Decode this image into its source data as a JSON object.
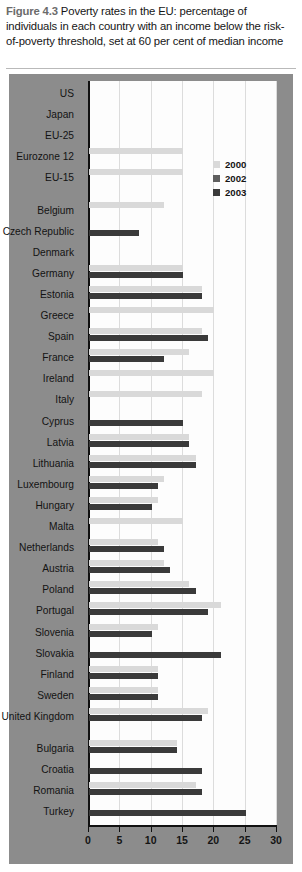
{
  "caption": {
    "figure_number": "Figure 4.3",
    "text": " Poverty rates in the EU: percentage of individuals in each country with an income below the risk-of-poverty threshold, set at 60 per cent of median income"
  },
  "legend": {
    "position": "top-right",
    "items": [
      {
        "label": "2000",
        "color": "#d9d9d9"
      },
      {
        "label": "2002",
        "color": "#5e5e5e"
      },
      {
        "label": "2003",
        "color": "#3a3a3a"
      }
    ]
  },
  "axis": {
    "x_ticks": [
      "0",
      "5",
      "10",
      "15",
      "20",
      "25",
      "30"
    ],
    "x_min": 0,
    "x_max": 30
  },
  "chart_data": {
    "type": "bar",
    "orientation": "horizontal",
    "title": "Poverty rates in the EU: percentage of individuals in each country with an income below the risk-of-poverty threshold, set at 60 per cent of median income",
    "xlabel": "",
    "ylabel": "",
    "xlim": [
      0,
      30
    ],
    "grid": "vertical",
    "legend_position": "top-right",
    "series": [
      {
        "name": "2000",
        "color": "#d9d9d9"
      },
      {
        "name": "2002",
        "color": "#5e5e5e"
      },
      {
        "name": "2003",
        "color": "#3a3a3a"
      }
    ],
    "categories": [
      "US",
      "Japan",
      "EU-25",
      "Eurozone 12",
      "EU-15",
      "Belgium",
      "Czech Republic",
      "Denmark",
      "Germany",
      "Estonia",
      "Greece",
      "Spain",
      "France",
      "Ireland",
      "Italy",
      "Cyprus",
      "Latvia",
      "Lithuania",
      "Luxembourg",
      "Hungary",
      "Malta",
      "Netherlands",
      "Austria",
      "Poland",
      "Portugal",
      "Slovenia",
      "Slovakia",
      "Finland",
      "Sweden",
      "United Kingdom",
      "Bulgaria",
      "Croatia",
      "Romania",
      "Turkey"
    ],
    "rows": [
      {
        "category": "US",
        "gap_before": false,
        "y2000": null,
        "y2002": null,
        "y2003": null
      },
      {
        "category": "Japan",
        "gap_before": false,
        "y2000": null,
        "y2002": null,
        "y2003": null
      },
      {
        "category": "EU-25",
        "gap_before": false,
        "y2000": null,
        "y2002": null,
        "y2003": null
      },
      {
        "category": "Eurozone 12",
        "gap_before": false,
        "y2000": 15,
        "y2002": null,
        "y2003": null
      },
      {
        "category": "EU-15",
        "gap_before": false,
        "y2000": 15,
        "y2002": null,
        "y2003": null
      },
      {
        "category": "Belgium",
        "gap_before": true,
        "y2000": 12,
        "y2002": null,
        "y2003": null
      },
      {
        "category": "Czech Republic",
        "gap_before": false,
        "y2000": null,
        "y2002": null,
        "y2003": 8
      },
      {
        "category": "Denmark",
        "gap_before": false,
        "y2000": null,
        "y2002": null,
        "y2003": null
      },
      {
        "category": "Germany",
        "gap_before": false,
        "y2000": 15,
        "y2002": null,
        "y2003": 15
      },
      {
        "category": "Estonia",
        "gap_before": false,
        "y2000": 18,
        "y2002": null,
        "y2003": 18
      },
      {
        "category": "Greece",
        "gap_before": false,
        "y2000": 20,
        "y2002": null,
        "y2003": null
      },
      {
        "category": "Spain",
        "gap_before": false,
        "y2000": 18,
        "y2002": null,
        "y2003": 19
      },
      {
        "category": "France",
        "gap_before": false,
        "y2000": 16,
        "y2002": null,
        "y2003": 12
      },
      {
        "category": "Ireland",
        "gap_before": false,
        "y2000": 20,
        "y2002": null,
        "y2003": null
      },
      {
        "category": "Italy",
        "gap_before": false,
        "y2000": 18,
        "y2002": null,
        "y2003": null
      },
      {
        "category": "Cyprus",
        "gap_before": false,
        "y2000": null,
        "y2002": null,
        "y2003": 15
      },
      {
        "category": "Latvia",
        "gap_before": false,
        "y2000": 16,
        "y2002": null,
        "y2003": 16
      },
      {
        "category": "Lithuania",
        "gap_before": false,
        "y2000": 17,
        "y2002": null,
        "y2003": 17
      },
      {
        "category": "Luxembourg",
        "gap_before": false,
        "y2000": 12,
        "y2002": null,
        "y2003": 11
      },
      {
        "category": "Hungary",
        "gap_before": false,
        "y2000": 11,
        "y2002": null,
        "y2003": 10
      },
      {
        "category": "Malta",
        "gap_before": false,
        "y2000": 15,
        "y2002": null,
        "y2003": null
      },
      {
        "category": "Netherlands",
        "gap_before": false,
        "y2000": 11,
        "y2002": null,
        "y2003": 12
      },
      {
        "category": "Austria",
        "gap_before": false,
        "y2000": 12,
        "y2002": null,
        "y2003": 13
      },
      {
        "category": "Poland",
        "gap_before": false,
        "y2000": 16,
        "y2002": null,
        "y2003": 17
      },
      {
        "category": "Portugal",
        "gap_before": false,
        "y2000": 21,
        "y2002": null,
        "y2003": 19
      },
      {
        "category": "Slovenia",
        "gap_before": false,
        "y2000": 11,
        "y2002": null,
        "y2003": 10
      },
      {
        "category": "Slovakia",
        "gap_before": false,
        "y2000": null,
        "y2002": null,
        "y2003": 21
      },
      {
        "category": "Finland",
        "gap_before": false,
        "y2000": 11,
        "y2002": null,
        "y2003": 11
      },
      {
        "category": "Sweden",
        "gap_before": false,
        "y2000": 11,
        "y2002": null,
        "y2003": 11
      },
      {
        "category": "United Kingdom",
        "gap_before": false,
        "y2000": 19,
        "y2002": null,
        "y2003": 18
      },
      {
        "category": "Bulgaria",
        "gap_before": true,
        "y2000": 14,
        "y2002": null,
        "y2003": 14
      },
      {
        "category": "Croatia",
        "gap_before": false,
        "y2000": null,
        "y2002": null,
        "y2003": 18
      },
      {
        "category": "Romania",
        "gap_before": false,
        "y2000": 17,
        "y2002": null,
        "y2003": 18
      },
      {
        "category": "Turkey",
        "gap_before": false,
        "y2000": null,
        "y2002": null,
        "y2003": 25
      }
    ]
  }
}
